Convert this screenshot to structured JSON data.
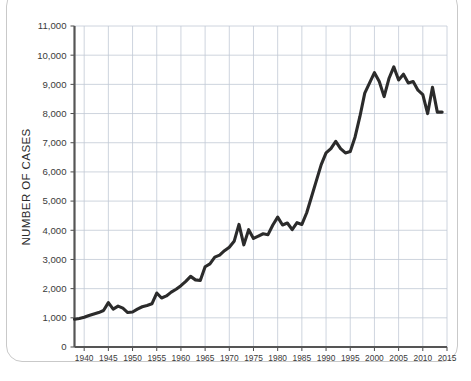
{
  "chart_data": {
    "type": "line",
    "title": "",
    "xlabel": "",
    "ylabel": "NUMBER OF CASES",
    "xlim": [
      1938,
      2015
    ],
    "ylim": [
      0,
      11000
    ],
    "grid": true,
    "legend": "none",
    "line_color": "#2b2b2b",
    "grid_color": "#c2c9d6",
    "axis_color": "#4a4a4a",
    "y_ticks": [
      0,
      1000,
      2000,
      3000,
      4000,
      5000,
      6000,
      7000,
      8000,
      9000,
      10000,
      11000
    ],
    "y_tick_labels": [
      "0",
      "1,000",
      "2,000",
      "3,000",
      "4,000",
      "5,000",
      "6,000",
      "7,000",
      "8,000",
      "9,000",
      "10,000",
      "11,000"
    ],
    "x_ticks": [
      1940,
      1945,
      1950,
      1955,
      1960,
      1965,
      1970,
      1975,
      1980,
      1985,
      1990,
      1995,
      2000,
      2005,
      2010,
      2015
    ],
    "x_tick_labels": [
      "1940",
      "1945",
      "1950",
      "1955",
      "1960",
      "1965",
      "1970",
      "1975",
      "1980",
      "1985",
      "1990",
      "1995",
      "2000",
      "2005",
      "2010",
      "2015"
    ],
    "x": [
      1938,
      1939,
      1940,
      1941,
      1942,
      1943,
      1944,
      1945,
      1946,
      1947,
      1948,
      1949,
      1950,
      1951,
      1952,
      1953,
      1954,
      1955,
      1956,
      1957,
      1958,
      1959,
      1960,
      1961,
      1962,
      1963,
      1964,
      1965,
      1966,
      1967,
      1968,
      1969,
      1970,
      1971,
      1972,
      1973,
      1974,
      1975,
      1976,
      1977,
      1978,
      1979,
      1980,
      1981,
      1982,
      1983,
      1984,
      1985,
      1986,
      1987,
      1988,
      1989,
      1990,
      1991,
      1992,
      1993,
      1994,
      1995,
      1996,
      1997,
      1998,
      1999,
      2000,
      2001,
      2002,
      2003,
      2004,
      2005,
      2006,
      2007,
      2008,
      2009,
      2010,
      2011,
      2012,
      2013,
      2014
    ],
    "values": [
      950,
      980,
      1020,
      1080,
      1130,
      1180,
      1250,
      1520,
      1300,
      1400,
      1330,
      1180,
      1200,
      1300,
      1380,
      1420,
      1480,
      1850,
      1680,
      1750,
      1880,
      1980,
      2100,
      2250,
      2420,
      2300,
      2280,
      2750,
      2850,
      3080,
      3150,
      3300,
      3420,
      3620,
      4200,
      3500,
      4020,
      3720,
      3800,
      3880,
      3850,
      4180,
      4450,
      4180,
      4250,
      4020,
      4260,
      4200,
      4600,
      5150,
      5700,
      6250,
      6650,
      6800,
      7050,
      6800,
      6650,
      6700,
      7200,
      7900,
      8700,
      9050,
      9400,
      9100,
      8580,
      9200,
      9600,
      9150,
      9350,
      9050,
      9100,
      8800,
      8650,
      8000,
      8900,
      8050,
      8050
    ],
    "series_name": "Number of cases"
  },
  "figure": {
    "card_label": "chart-card"
  }
}
